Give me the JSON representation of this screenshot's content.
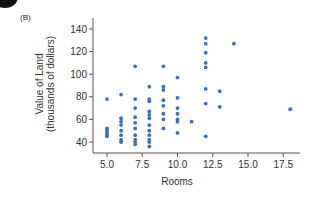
{
  "panel_label": "(B)",
  "chart_data": {
    "type": "scatter",
    "title": "",
    "xlabel": "Rooms",
    "ylabel": "Value of Land",
    "ylabel_sub": "(thousands of dollars)",
    "xlim": [
      4.5,
      18.5
    ],
    "ylim": [
      33,
      148
    ],
    "xticks": [
      5.0,
      7.5,
      10.0,
      12.5,
      15.0,
      17.5
    ],
    "xtick_labels": [
      "5.0",
      "7.5",
      "10.0",
      "12.5",
      "15.0",
      "17.5"
    ],
    "yticks": [
      40,
      60,
      80,
      100,
      120,
      140
    ],
    "ytick_labels": [
      "40",
      "60",
      "80",
      "100",
      "120",
      "140"
    ],
    "grid": false,
    "legend": null,
    "marker_color": "#3a6fc4",
    "points": [
      {
        "x": 5,
        "y": 78
      },
      {
        "x": 5,
        "y": 52
      },
      {
        "x": 5,
        "y": 50
      },
      {
        "x": 5,
        "y": 48
      },
      {
        "x": 5,
        "y": 46
      },
      {
        "x": 5,
        "y": 45
      },
      {
        "x": 6,
        "y": 82
      },
      {
        "x": 6,
        "y": 61
      },
      {
        "x": 6,
        "y": 58
      },
      {
        "x": 6,
        "y": 55
      },
      {
        "x": 6,
        "y": 50
      },
      {
        "x": 6,
        "y": 46
      },
      {
        "x": 6,
        "y": 42
      },
      {
        "x": 6,
        "y": 40
      },
      {
        "x": 7,
        "y": 107
      },
      {
        "x": 7,
        "y": 78
      },
      {
        "x": 7,
        "y": 70
      },
      {
        "x": 7,
        "y": 62
      },
      {
        "x": 7,
        "y": 57
      },
      {
        "x": 7,
        "y": 52
      },
      {
        "x": 7,
        "y": 46
      },
      {
        "x": 7,
        "y": 42
      },
      {
        "x": 7,
        "y": 40
      },
      {
        "x": 7,
        "y": 38
      },
      {
        "x": 8,
        "y": 89
      },
      {
        "x": 8,
        "y": 78
      },
      {
        "x": 8,
        "y": 76
      },
      {
        "x": 8,
        "y": 67
      },
      {
        "x": 8,
        "y": 64
      },
      {
        "x": 8,
        "y": 61
      },
      {
        "x": 8,
        "y": 55
      },
      {
        "x": 8,
        "y": 50
      },
      {
        "x": 8,
        "y": 46
      },
      {
        "x": 8,
        "y": 42
      },
      {
        "x": 8,
        "y": 40
      },
      {
        "x": 8,
        "y": 36
      },
      {
        "x": 9,
        "y": 107
      },
      {
        "x": 9,
        "y": 89
      },
      {
        "x": 9,
        "y": 86
      },
      {
        "x": 9,
        "y": 77
      },
      {
        "x": 9,
        "y": 72
      },
      {
        "x": 9,
        "y": 65
      },
      {
        "x": 9,
        "y": 60
      },
      {
        "x": 9,
        "y": 52
      },
      {
        "x": 10,
        "y": 97
      },
      {
        "x": 10,
        "y": 79
      },
      {
        "x": 10,
        "y": 70
      },
      {
        "x": 10,
        "y": 65
      },
      {
        "x": 10,
        "y": 60
      },
      {
        "x": 10,
        "y": 58
      },
      {
        "x": 10,
        "y": 48
      },
      {
        "x": 11,
        "y": 58
      },
      {
        "x": 12,
        "y": 132
      },
      {
        "x": 12,
        "y": 127
      },
      {
        "x": 12,
        "y": 119
      },
      {
        "x": 12,
        "y": 110
      },
      {
        "x": 12,
        "y": 106
      },
      {
        "x": 12,
        "y": 87
      },
      {
        "x": 12,
        "y": 74
      },
      {
        "x": 12,
        "y": 45
      },
      {
        "x": 13,
        "y": 85
      },
      {
        "x": 13,
        "y": 71
      },
      {
        "x": 14,
        "y": 127
      },
      {
        "x": 18,
        "y": 69
      }
    ]
  }
}
